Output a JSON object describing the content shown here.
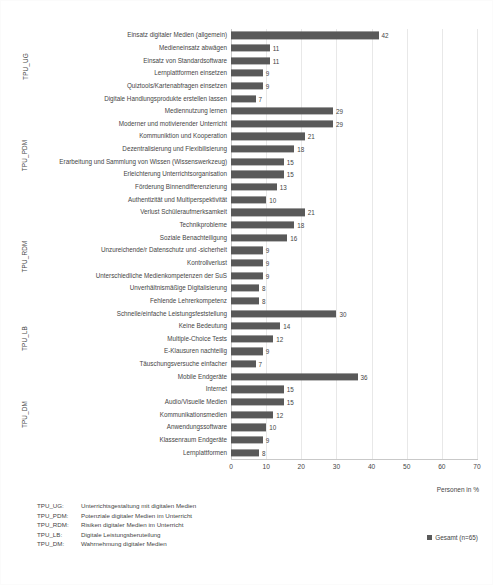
{
  "chart_data": {
    "type": "bar",
    "orientation": "horizontal",
    "title": "",
    "xlabel": "Personen in %",
    "ylabel": "",
    "xlim": [
      0,
      70
    ],
    "xticks": [
      0,
      10,
      20,
      30,
      40,
      50,
      60,
      70
    ],
    "grid": true,
    "legend_position": "bottom-right",
    "series": [
      {
        "name": "Gesamt (n=65)",
        "color": "#595959",
        "values": [
          42,
          11,
          11,
          9,
          9,
          7,
          29,
          29,
          21,
          18,
          15,
          15,
          13,
          10,
          21,
          18,
          16,
          9,
          9,
          9,
          8,
          8,
          30,
          14,
          12,
          9,
          7,
          36,
          15,
          15,
          12,
          10,
          9,
          8
        ]
      }
    ],
    "categories": [
      "Einsatz digitaler Medien (allgemein)",
      "Medieneinsatz abwägen",
      "Einsatz von Standardsoftware",
      "Lernplattformen einsetzen",
      "Quiztools/Kartenabfragen einsetzen",
      "Digitale Handlungsprodukte erstellen lassen",
      "Mediennutzung lernen",
      "Moderner und motivierender Unterricht",
      "Kommuniktion und Kooperation",
      "Dezentralisierung und Flexibilisierung",
      "Erarbeitung und Sammlung von Wissen (Wissenswerkzeug)",
      "Erleichterung Unterrichtsorganisation",
      "Förderung Binnendifferenzierung",
      "Authentizität und Multiperspektivität",
      "Verlust Schüleraufmerksamkeit",
      "Technikprobleme",
      "Soziale Benachteiligung",
      "Unzureichende/r Datenschutz und -sicherheit",
      "Kontrollverlust",
      "Unterschiedliche Medienkompetenzen der SuS",
      "Unverhältnismäßige Digitalisierung",
      "Fehlende Lehrerkompetenz",
      "Schnelle/einfache Leistungsfeststellung",
      "Keine Bedeutung",
      "Multiple-Choice Tests",
      "E-Klausuren nachteilig",
      "Täuschungsversuche einfacher",
      "Mobile Endgeräte",
      "Internet",
      "Audio/Visuelle Medien",
      "Kommunikationsmedien",
      "Anwendungssoftware",
      "Klassenraum Endgeräte",
      "Lernplattformen"
    ],
    "groups": [
      {
        "code": "TPU_UG",
        "start": 0,
        "count": 6
      },
      {
        "code": "TPU_PDM",
        "start": 6,
        "count": 8
      },
      {
        "code": "TPU_RDM",
        "start": 14,
        "count": 8
      },
      {
        "code": "TPU_LB",
        "start": 22,
        "count": 5
      },
      {
        "code": "TPU_DM",
        "start": 27,
        "count": 7
      }
    ]
  },
  "legend": {
    "label": "Gesamt (n=65)",
    "color": "#595959"
  },
  "axis": {
    "x_title": "Personen in %"
  },
  "abbreviations": [
    {
      "code": "TPU_UG:",
      "description": "Unterrichtsgestaltung mit digitalen Medien"
    },
    {
      "code": "TPU_PDM:",
      "description": "Potenziale digitaler Medien im Unterricht"
    },
    {
      "code": "TPU_RDM:",
      "description": "Risiken digitaler Medien im Unterricht"
    },
    {
      "code": "TPU_LB:",
      "description": "Digitale Leistungsberuteilung"
    },
    {
      "code": "TPU_DM:",
      "description": "Wahrnehmung digitaler Medien"
    }
  ]
}
